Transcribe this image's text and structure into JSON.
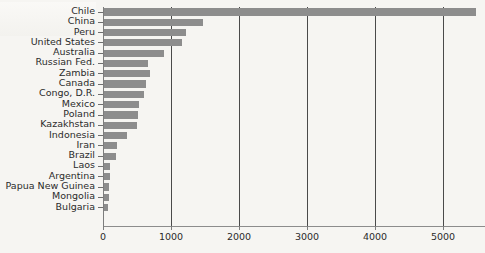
{
  "chart_data": {
    "type": "bar",
    "orientation": "horizontal",
    "title": "",
    "xlabel": "",
    "ylabel": "",
    "xlim": [
      0,
      5620
    ],
    "xticks": [
      0,
      1000,
      2000,
      3000,
      4000,
      5000
    ],
    "xtick_labels": [
      "0",
      "1000",
      "2000",
      "3000",
      "4000",
      "5000"
    ],
    "grid": "vertical",
    "legend": "none",
    "bar_color": "#8d8d8d",
    "background_color": "#f6f5f2",
    "gridline_color": "#4a4a4a",
    "axis_color": "#7d7d7d",
    "text_color": "#2b2b2b",
    "categories": [
      "Chile",
      "China",
      "Peru",
      "United States",
      "Australia",
      "Russian Fed.",
      "Zambia",
      "Canada",
      "Congo, D.R.",
      "Mexico",
      "Poland",
      "Kazakhstan",
      "Indonesia",
      "Iran",
      "Brazil",
      "Laos",
      "Argentina",
      "Papua New Guinea",
      "Mongolia",
      "Bulgaria"
    ],
    "values": [
      5470,
      1455,
      1205,
      1145,
      880,
      650,
      675,
      620,
      590,
      520,
      500,
      490,
      345,
      195,
      180,
      90,
      85,
      80,
      70,
      60
    ]
  }
}
